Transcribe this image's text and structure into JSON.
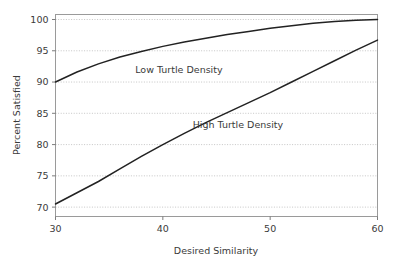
{
  "chart_data": {
    "type": "line",
    "title": "",
    "xlabel": "Desired Similarity",
    "ylabel": "Percent Satisfied",
    "xlim": [
      30,
      60
    ],
    "ylim": [
      68.5,
      100.8
    ],
    "xticks": [
      30,
      40,
      50,
      60
    ],
    "yticks": [
      70,
      75,
      80,
      85,
      90,
      95,
      100
    ],
    "xtick_labels": [
      "30",
      "40",
      "50",
      "60"
    ],
    "ytick_labels": [
      "70",
      "75",
      "80",
      "85",
      "90",
      "95",
      "100"
    ],
    "grid": true,
    "grid_axis": "y",
    "legend": "inline-annotations",
    "line_color": "#222222",
    "grid_color": "#b8b8b8",
    "frame_color": "#9a9a9a",
    "background": "#ffffff",
    "x": [
      30,
      32,
      34,
      36,
      38,
      40,
      42,
      44,
      46,
      48,
      50,
      52,
      54,
      56,
      58,
      60
    ],
    "series": [
      {
        "name": "Low Turtle Density",
        "annotation": "Low Turtle Density",
        "annotation_x": 41.5,
        "annotation_y": 91.4,
        "values": [
          90.0,
          91.6,
          92.9,
          94.0,
          94.9,
          95.7,
          96.4,
          97.0,
          97.6,
          98.1,
          98.6,
          99.0,
          99.4,
          99.7,
          99.9,
          100.0
        ]
      },
      {
        "name": "High Turtle Density",
        "annotation": "High Turtle Density",
        "annotation_x": 47.0,
        "annotation_y": 82.6,
        "values": [
          70.5,
          72.3,
          74.1,
          76.1,
          78.1,
          80.0,
          81.8,
          83.5,
          85.1,
          86.7,
          88.3,
          90.0,
          91.7,
          93.4,
          95.1,
          96.7
        ]
      }
    ]
  }
}
